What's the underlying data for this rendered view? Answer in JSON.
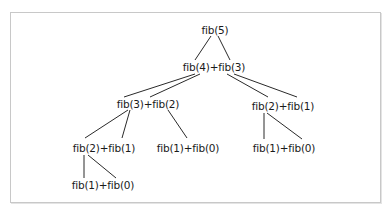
{
  "diagram": {
    "type": "recursion-tree",
    "nodes": {
      "root": "fib(5)",
      "l1": "fib(4)+fib(3)",
      "l2_left": "fib(3)+fib(2)",
      "l2_right": "fib(2)+fib(1)",
      "l3_left": "fib(2)+fib(1)",
      "l3_mid": "fib(1)+fib(0)",
      "l3_right": "fib(1)+fib(0)",
      "l4_left": "fib(1)+fib(0)"
    },
    "edges": [
      [
        "root",
        "l1"
      ],
      [
        "root",
        "l1"
      ],
      [
        "l1",
        "l2_left"
      ],
      [
        "l1",
        "l2_left"
      ],
      [
        "l1",
        "l2_right"
      ],
      [
        "l1",
        "l2_right"
      ],
      [
        "l2_left",
        "l3_left"
      ],
      [
        "l2_left",
        "l3_left"
      ],
      [
        "l2_left",
        "l3_mid"
      ],
      [
        "l2_right",
        "l3_right"
      ],
      [
        "l2_right",
        "l3_right"
      ],
      [
        "l3_left",
        "l4_left"
      ],
      [
        "l3_left",
        "l4_left"
      ]
    ]
  }
}
